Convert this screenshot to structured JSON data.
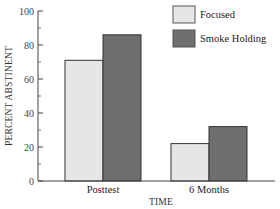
{
  "chart_data": {
    "type": "bar",
    "title": "",
    "xlabel": "TIME",
    "ylabel": "PERCENT ABSTINENT",
    "categories": [
      "Posttest",
      "6 Months"
    ],
    "series": [
      {
        "name": "Focused",
        "values": [
          71,
          22
        ],
        "color": "#e6e6e6"
      },
      {
        "name": "Smoke Holding",
        "values": [
          86,
          32
        ],
        "color": "#6f6f6f"
      }
    ],
    "ylim": [
      0,
      100
    ],
    "yticks": [
      0,
      20,
      40,
      60,
      80,
      100
    ],
    "minor_ticks": [
      10,
      30,
      50,
      70,
      90
    ],
    "grid": false,
    "legend_position": "top-right"
  }
}
